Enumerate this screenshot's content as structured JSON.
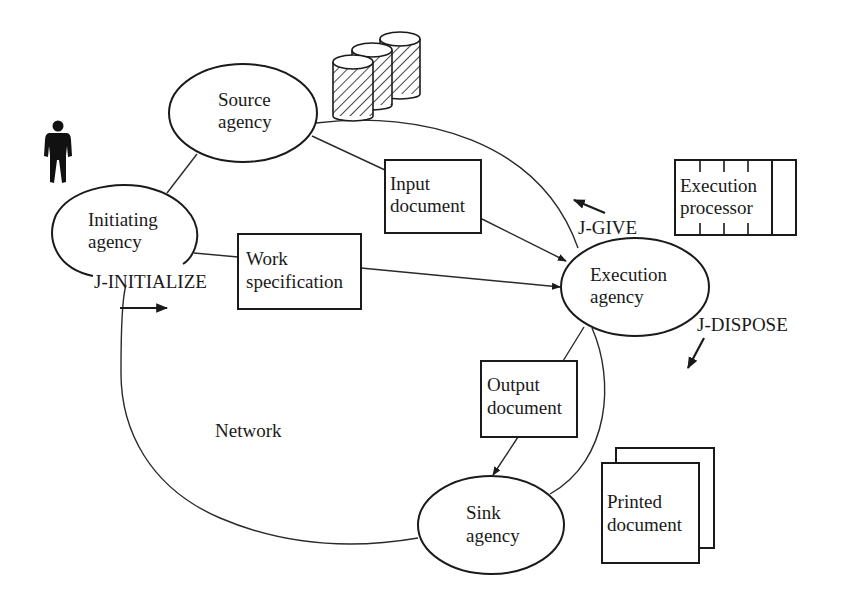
{
  "diagram": {
    "type": "network-job-transfer",
    "background": "#ffffff",
    "ink_color": "#1a1a1a",
    "network_label": "Network",
    "nodes": {
      "source_agency": {
        "line1": "Source",
        "line2": "agency",
        "shape": "ellipse"
      },
      "initiating_agency": {
        "line1": "Initiating",
        "line2": "agency",
        "shape": "ellipse"
      },
      "execution_agency": {
        "line1": "Execution",
        "line2": "agency",
        "shape": "ellipse"
      },
      "sink_agency": {
        "line1": "Sink",
        "line2": "agency",
        "shape": "ellipse"
      }
    },
    "documents": {
      "input_document": {
        "line1": "Input",
        "line2": "document",
        "shape": "rectangle"
      },
      "work_specification": {
        "line1": "Work",
        "line2": "specification",
        "shape": "rectangle"
      },
      "output_document": {
        "line1": "Output",
        "line2": "document",
        "shape": "rectangle"
      },
      "printed_document": {
        "line1": "Printed",
        "line2": "document",
        "shape": "stacked-pages"
      }
    },
    "resources": {
      "execution_processor": {
        "line1": "Execution",
        "line2": "processor",
        "shape": "processor-box"
      },
      "storage": {
        "icon": "database-cylinders-icon",
        "count": 3
      },
      "user": {
        "icon": "person-icon"
      }
    },
    "operations": {
      "initialize": "J-INITIALIZE",
      "give": "J-GIVE",
      "dispose": "J-DISPOSE"
    },
    "edges": [
      {
        "from": "initiating_agency",
        "to": "source_agency",
        "arrow": false
      },
      {
        "from": "source_agency",
        "to": "input_document",
        "arrow": false
      },
      {
        "from": "input_document",
        "to": "execution_agency",
        "arrow": true
      },
      {
        "from": "initiating_agency",
        "to": "work_specification",
        "arrow": false
      },
      {
        "from": "work_specification",
        "to": "execution_agency",
        "arrow": true
      },
      {
        "from": "execution_agency",
        "to": "output_document",
        "arrow": false
      },
      {
        "from": "output_document",
        "to": "sink_agency",
        "arrow": true
      },
      {
        "from": "source_agency",
        "to": "execution_agency",
        "arrow": false,
        "style": "curve"
      },
      {
        "from": "execution_agency",
        "to": "sink_agency",
        "arrow": false,
        "style": "curve"
      },
      {
        "from": "sink_agency",
        "to": "initiating_agency",
        "arrow": false,
        "style": "network-loop"
      }
    ]
  }
}
